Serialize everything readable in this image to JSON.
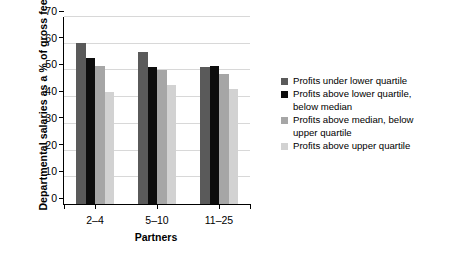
{
  "chart_data": {
    "type": "bar",
    "title": "",
    "xlabel": "Partners",
    "ylabel": "Departmental salaries as a % of gross fees",
    "categories": [
      "2–4",
      "5–10",
      "11–25"
    ],
    "ylim": [
      0,
      70
    ],
    "yticks": [
      0,
      10,
      20,
      30,
      40,
      50,
      60,
      70
    ],
    "grid": "horizontal",
    "legend_position": "right",
    "series": [
      {
        "name": "Profits under lower quartile",
        "color": "#5a5a5a",
        "values": [
          60.3,
          56.8,
          51.2
        ]
      },
      {
        "name": "Profits above lower quartile,\nbelow median",
        "color": "#0d0d0d",
        "values": [
          54.8,
          51.2,
          51.8
        ]
      },
      {
        "name": "Profits above median, below\nupper quartile",
        "color": "#a6a6a6",
        "values": [
          51.5,
          50.1,
          48.8
        ]
      },
      {
        "name": "Profits above upper quartile",
        "color": "#d2d2d2",
        "values": [
          42.1,
          44.6,
          43.2
        ]
      }
    ]
  },
  "axes": {
    "ytick_labels": [
      "0",
      "10",
      "20",
      "30",
      "40",
      "50",
      "60",
      "70"
    ],
    "xtick_labels": [
      "2–4",
      "5–10",
      "11–25"
    ],
    "xaxis_title": "Partners",
    "yaxis_title": "Departmental salaries as a % of gross fees"
  },
  "legend": {
    "items": [
      {
        "label": "Profits under lower quartile",
        "color": "#5a5a5a"
      },
      {
        "label": "Profits above lower quartile,\nbelow median",
        "color": "#0d0d0d"
      },
      {
        "label": "Profits above median, below\nupper quartile",
        "color": "#a6a6a6"
      },
      {
        "label": "Profits above upper quartile",
        "color": "#d2d2d2"
      }
    ]
  },
  "style": {
    "axis_color": "#000000",
    "grid_color": "#d8d8d8",
    "background": "#ffffff"
  }
}
